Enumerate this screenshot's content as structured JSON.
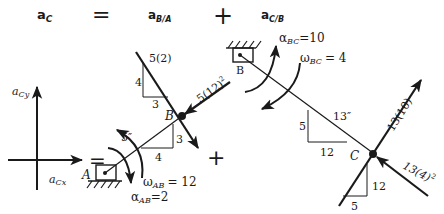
{
  "header": {
    "term_lhs": {
      "base": "a",
      "sub": "C"
    },
    "equals": "=",
    "term_1": {
      "base": "a",
      "sub": "B/A"
    },
    "plus": "+",
    "term_2": {
      "base": "a",
      "sub": "C/B"
    }
  },
  "components": {
    "ay": {
      "base": "a",
      "sub": "Cy"
    },
    "ax": {
      "base": "a",
      "sub": "Cx"
    },
    "equals": "=",
    "plus": "+"
  },
  "link_ab": {
    "pin_label": "A",
    "joint_label": "B",
    "length_label": "5″",
    "tri_rise": "3",
    "tri_run": "4",
    "omega": {
      "sym": "ω",
      "sub": "AB",
      "value": "= 12"
    },
    "alpha": {
      "sym": "α",
      "sub": "AB",
      "value": "=2"
    },
    "normal_accel": {
      "label": "5(12)",
      "exp": "2"
    },
    "tangential_accel": {
      "label": "5(2)"
    },
    "tangential_tri_rise": "4",
    "tangential_tri_run": "3"
  },
  "link_bc": {
    "pin_label": "B",
    "joint_label": "C",
    "length_label": "13″",
    "tri_rise": "5",
    "tri_run": "12",
    "omega": {
      "sym": "ω",
      "sub": "BC",
      "value": "= 4"
    },
    "alpha": {
      "sym": "α",
      "sub": "BC",
      "value": "=10"
    },
    "tangential_accel": {
      "label": "13(10)"
    },
    "normal_accel": {
      "label": "13(4)",
      "exp": "2"
    },
    "tangential_tri_rise": "12",
    "tangential_tri_run": "5"
  },
  "colors": {
    "ink": "#1a1a1a",
    "background": "#ffffff"
  }
}
